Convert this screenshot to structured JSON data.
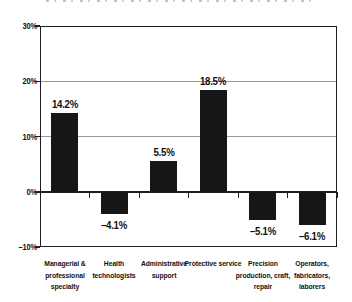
{
  "chart_data": {
    "type": "bar",
    "categories": [
      "Managerial & professional specialty",
      "Health technologists",
      "Administrative support",
      "Protective service",
      "Precision production, craft, repair",
      "Operators, fabricators, laborers"
    ],
    "category_lines": [
      [
        "Managerial &",
        "professional",
        "specialty"
      ],
      [
        "Health",
        "technologists"
      ],
      [
        "Administrative",
        "support"
      ],
      [
        "Protective service"
      ],
      [
        "Precision",
        "production, craft,",
        "repair"
      ],
      [
        "Operators,",
        "fabricators,",
        "laborers"
      ]
    ],
    "values": [
      14.2,
      -4.1,
      5.5,
      18.5,
      -5.1,
      -6.1
    ],
    "value_labels": [
      "14.2%",
      "–4.1%",
      "5.5%",
      "18.5%",
      "–5.1%",
      "–6.1%"
    ],
    "ylim": [
      -10,
      30
    ],
    "yticks": [
      30,
      20,
      10,
      0,
      -10
    ],
    "ytick_labels": [
      "30%",
      "20%",
      "10%",
      "0%",
      "–10%"
    ],
    "gridlines_at": [
      20,
      10
    ],
    "legend": "none",
    "title_visible": "clipped at top edge, illegible",
    "colors": {
      "bar": "#161616",
      "grid": "#9b9b9b",
      "axis": "#1f1f1f",
      "text": "#111111",
      "background": "#ffffff"
    }
  }
}
